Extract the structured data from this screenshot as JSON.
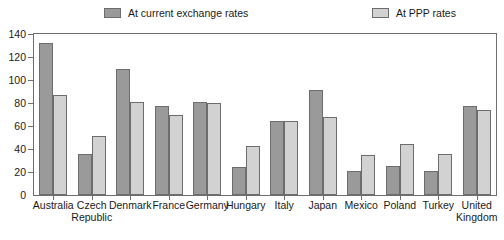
{
  "chart_data": {
    "type": "bar",
    "title": "",
    "subtitle": "",
    "xlabel": "",
    "ylabel": "",
    "ylim": [
      0,
      140
    ],
    "ytick_step": 20,
    "yticks": [
      0,
      20,
      40,
      60,
      80,
      100,
      120,
      140
    ],
    "grid": false,
    "legend_position": "top",
    "categories": [
      "Australia",
      "Czech Republic",
      "Denmark",
      "France",
      "Germany",
      "Hungary",
      "Italy",
      "Japan",
      "Mexico",
      "Poland",
      "Turkey",
      "United Kingdom"
    ],
    "category_lines": [
      [
        "Australia",
        ""
      ],
      [
        "Czech",
        "Republic"
      ],
      [
        "Denmark",
        ""
      ],
      [
        "France",
        ""
      ],
      [
        "Germany",
        ""
      ],
      [
        "Hungary",
        ""
      ],
      [
        "Italy",
        ""
      ],
      [
        "Japan",
        ""
      ],
      [
        "Mexico",
        ""
      ],
      [
        "Poland",
        ""
      ],
      [
        "Turkey",
        ""
      ],
      [
        "United",
        "Kingdom"
      ]
    ],
    "series": [
      {
        "name": "At current exchange rates",
        "color": "#9a9a9a",
        "values": [
          132,
          36,
          110,
          77,
          81,
          24,
          64,
          91,
          21,
          25,
          21,
          77
        ]
      },
      {
        "name": "At PPP rates",
        "color": "#d2d2d2",
        "values": [
          87,
          51,
          81,
          70,
          80,
          43,
          64,
          68,
          35,
          44,
          36,
          74
        ]
      }
    ]
  },
  "colors": {
    "series_current": "#9a9a9a",
    "series_ppp": "#d2d2d2",
    "bar_border": "#6d6d6d",
    "axis": "#6e6e6e",
    "text": "#1a1a1a",
    "background": "#ffffff"
  }
}
